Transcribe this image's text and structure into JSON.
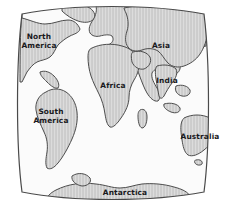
{
  "figure": {
    "kind": "world-map",
    "projection_frame": "lens-barrel",
    "background_color": "#ffffff",
    "ocean_color": "#fbfbfb",
    "land_fill_color": "#c9c9c9",
    "land_hatch_color": "#d8d8d8",
    "land_outline_color": "#4c4c4c",
    "frame_line_color": "#4a4a4a",
    "label_color": "#19191c"
  },
  "map": {
    "labels": [
      {
        "name": "north-america",
        "text": "North\nAmerica",
        "x": 39,
        "y": 42
      },
      {
        "name": "south-america",
        "text": "South\nAmerica",
        "x": 51,
        "y": 117
      },
      {
        "name": "africa",
        "text": "Africa",
        "x": 113,
        "y": 86
      },
      {
        "name": "asia",
        "text": "Asia",
        "x": 161,
        "y": 46
      },
      {
        "name": "india",
        "text": "India",
        "x": 167,
        "y": 81
      },
      {
        "name": "australia",
        "text": "Australia",
        "x": 200,
        "y": 137
      },
      {
        "name": "antarctica",
        "text": "Antarctica",
        "x": 125,
        "y": 193
      }
    ]
  }
}
